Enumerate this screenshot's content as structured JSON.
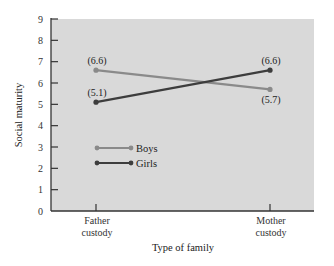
{
  "chart_data": {
    "type": "line",
    "title": "",
    "xlabel": "Type of family",
    "ylabel": "Social maturity",
    "categories": [
      "Father custody",
      "Mother custody"
    ],
    "category_lines": [
      [
        "Father",
        "custody"
      ],
      [
        "Mother",
        "custody"
      ]
    ],
    "ylim": [
      0,
      9
    ],
    "yticks": [
      "0",
      "1",
      "2",
      "3",
      "4",
      "5",
      "6",
      "7",
      "8",
      "9"
    ],
    "grid": false,
    "legend_position": "inside lower left",
    "series": [
      {
        "name": "Boys",
        "values": [
          6.6,
          5.7
        ],
        "labels": [
          "(6.6)",
          "(5.7)"
        ],
        "color": "#8a8a8a"
      },
      {
        "name": "Girls",
        "values": [
          5.1,
          6.6
        ],
        "labels": [
          "(5.1)",
          "(6.6)"
        ],
        "color": "#3d3d3d"
      }
    ]
  },
  "colors": {
    "plot_background": "#d9d9d9",
    "axis": "#333333"
  }
}
